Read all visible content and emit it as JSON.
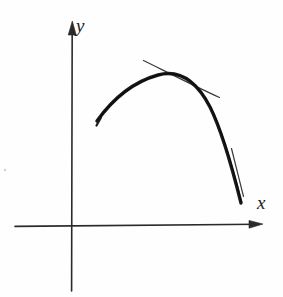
{
  "figure": {
    "kind": "hand-drawn-diagram",
    "background_color": "#fefefe",
    "ink_color": "#1b1b1b",
    "width": 283,
    "height": 297,
    "axes": {
      "origin": {
        "x": 72,
        "y": 225
      },
      "x_axis": {
        "label": "x",
        "label_position": {
          "x": 257,
          "y": 193
        },
        "start": {
          "x": 15,
          "y": 226
        },
        "end": {
          "x": 262,
          "y": 224
        },
        "arrow": "right",
        "stroke_width": 1.6
      },
      "y_axis": {
        "label": "y",
        "label_position": {
          "x": 76,
          "y": 16
        },
        "start": {
          "x": 72,
          "y": 291
        },
        "end": {
          "x": 72,
          "y": 22
        },
        "arrow": "up",
        "stroke_width": 1.6
      }
    },
    "curve": {
      "name": "concave-down-curve",
      "stroke_width": 3.4,
      "path": "M 97 121 C 112 100, 133 82, 158 75 C 180 69, 197 82, 210 107 C 222 131, 232 167, 241 203",
      "start_point": {
        "x": 97,
        "y": 121
      },
      "apex": {
        "x": 166,
        "y": 74
      },
      "end_point": {
        "x": 241,
        "y": 203
      }
    },
    "tangent_lines": [
      {
        "name": "tangent-at-apex",
        "stroke_width": 1.2,
        "start": {
          "x": 143,
          "y": 60
        },
        "end": {
          "x": 219,
          "y": 97
        },
        "description": "thin straight line touching the curve near its maximum"
      },
      {
        "name": "tangent-at-descent",
        "stroke_width": 1.2,
        "start": {
          "x": 231,
          "y": 148
        },
        "end": {
          "x": 243,
          "y": 196
        },
        "description": "short thin line along the steep descending branch"
      }
    ],
    "speck": {
      "name": "paper-speck",
      "position": {
        "x": 5,
        "y": 170
      },
      "radius": 1.2
    }
  }
}
